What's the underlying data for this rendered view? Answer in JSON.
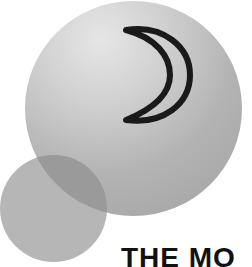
{
  "logo": {
    "brand_text": "THE MO",
    "icon": "crescent-moon-icon",
    "colors": {
      "background": "#ffffff",
      "big_circle_light": "#e6e6e6",
      "big_circle_dark": "#a5a5a5",
      "small_circle": "#b0b0b0",
      "overlap": "#9a9a9a",
      "crescent_stroke": "#1a1a1a",
      "text": "#111111"
    }
  }
}
